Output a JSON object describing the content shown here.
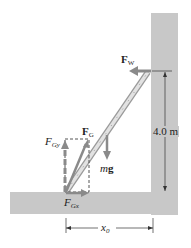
{
  "diagram": {
    "colors": {
      "surface": "#c8c8c8",
      "force_arrow": "#8a8a8a",
      "ladder": "#d6d6d6",
      "ladder_outline": "#9a9a9a",
      "text": "#222222",
      "dimension": "#333333"
    },
    "labels": {
      "fw": {
        "symbol": "F",
        "sub": "W"
      },
      "fg": {
        "symbol": "F",
        "sub": "G"
      },
      "fgy": {
        "symbol": "F",
        "sub": "Gy"
      },
      "fgx": {
        "symbol": "F",
        "sub": "Gx"
      },
      "mg": {
        "m": "m",
        "g": "g"
      },
      "height": "4.0 m",
      "x0": {
        "symbol": "x",
        "sub": "0"
      }
    }
  }
}
